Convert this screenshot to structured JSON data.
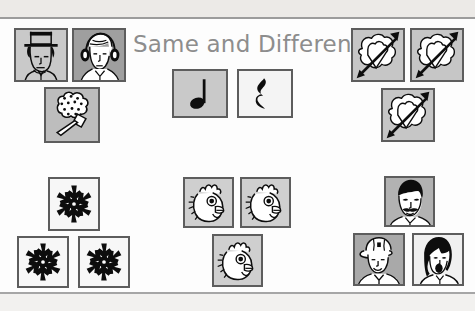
{
  "slide": {
    "title": "Same and Different",
    "title_color": "#8d8d8d",
    "background_color": "#fdfdfd",
    "band_color": "#eceae7",
    "rule_color": "#9c9c9c"
  },
  "groups": [
    {
      "id": "group-people-top-left",
      "name": "people-and-bouquet-group",
      "relation": "different",
      "tiles": [
        {
          "icon": "man-in-top-hat-icon",
          "label": "Man in top hat",
          "bg": "#c9c9c9",
          "x": 14,
          "y": 28,
          "w": 54,
          "h": 54
        },
        {
          "icon": "person-with-headphones-icon",
          "label": "Person with headphones",
          "bg": "#9f9f9f",
          "x": 72,
          "y": 28,
          "w": 54,
          "h": 54
        },
        {
          "icon": "bouquet-with-mallet-icon",
          "label": "Bouquet with mallet",
          "bg": "#bdbdbd",
          "x": 44,
          "y": 87,
          "w": 56,
          "h": 56
        }
      ]
    },
    {
      "id": "group-music-center-top",
      "name": "music-notation-group",
      "relation": "different",
      "tiles": [
        {
          "icon": "quarter-note-icon",
          "label": "Quarter note",
          "bg": "#c9c9c9",
          "x": 172,
          "y": 69,
          "w": 56,
          "h": 49
        },
        {
          "icon": "quarter-rest-icon",
          "label": "Quarter rest",
          "bg": "#f4f4f4",
          "x": 237,
          "y": 69,
          "w": 56,
          "h": 49
        }
      ]
    },
    {
      "id": "group-hearts-top-right",
      "name": "heart-with-arrow-group",
      "relation": "same",
      "tiles": [
        {
          "icon": "heart-with-arrow-icon",
          "label": "Heart pierced by arrow",
          "bg": "#c6c6c6",
          "x": 351,
          "y": 28,
          "w": 54,
          "h": 54
        },
        {
          "icon": "heart-with-arrow-icon",
          "label": "Heart pierced by arrow",
          "bg": "#c6c6c6",
          "x": 410,
          "y": 28,
          "w": 54,
          "h": 54
        },
        {
          "icon": "heart-with-arrow-icon",
          "label": "Heart pierced by arrow",
          "bg": "#c6c6c6",
          "x": 381,
          "y": 88,
          "w": 54,
          "h": 54
        }
      ]
    },
    {
      "id": "group-snowflakes-bottom-left",
      "name": "snowflake-group",
      "relation": "same",
      "tiles": [
        {
          "icon": "snowflake-icon",
          "label": "Snowflake",
          "bg": "#f7f7f7",
          "x": 48,
          "y": 177,
          "w": 52,
          "h": 54
        },
        {
          "icon": "snowflake-icon",
          "label": "Snowflake",
          "bg": "#f7f7f7",
          "x": 17,
          "y": 236,
          "w": 52,
          "h": 52
        },
        {
          "icon": "snowflake-icon",
          "label": "Snowflake",
          "bg": "#f7f7f7",
          "x": 78,
          "y": 236,
          "w": 52,
          "h": 52
        }
      ]
    },
    {
      "id": "group-chickens-bottom-center",
      "name": "chicken-head-group",
      "relation": "same",
      "tiles": [
        {
          "icon": "chicken-head-icon",
          "label": "Chicken head",
          "bg": "#cfcfcf",
          "x": 183,
          "y": 177,
          "w": 51,
          "h": 51
        },
        {
          "icon": "chicken-head-icon",
          "label": "Chicken head",
          "bg": "#cfcfcf",
          "x": 240,
          "y": 177,
          "w": 51,
          "h": 51
        },
        {
          "icon": "chicken-head-icon",
          "label": "Chicken head",
          "bg": "#cfcfcf",
          "x": 212,
          "y": 234,
          "w": 51,
          "h": 53
        }
      ]
    },
    {
      "id": "group-faces-bottom-right",
      "name": "face-group",
      "relation": "different",
      "tiles": [
        {
          "icon": "man-with-mustache-icon",
          "label": "Man with mustache",
          "bg": "#b2b2b2",
          "x": 384,
          "y": 176,
          "w": 51,
          "h": 51
        },
        {
          "icon": "person-in-cap-icon",
          "label": "Person wearing a cap",
          "bg": "#a9a9a9",
          "x": 353,
          "y": 233,
          "w": 52,
          "h": 53
        },
        {
          "icon": "woman-singing-icon",
          "label": "Woman singing",
          "bg": "#f0f0f0",
          "x": 412,
          "y": 233,
          "w": 52,
          "h": 53
        }
      ]
    }
  ]
}
